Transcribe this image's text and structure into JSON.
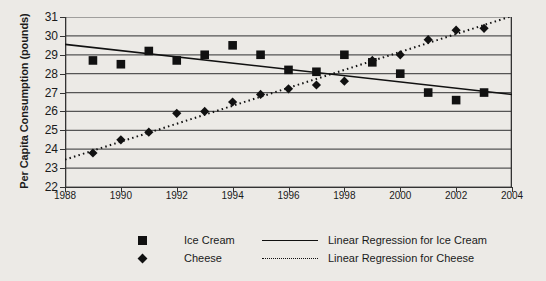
{
  "chart_data": {
    "type": "scatter",
    "title": "",
    "xlabel": "",
    "ylabel": "Per Capita Consumption (pounds)",
    "xlim": [
      1988,
      2004
    ],
    "ylim": [
      22,
      31
    ],
    "xticks": [
      1988,
      1990,
      1992,
      1994,
      1996,
      1998,
      2000,
      2002,
      2004
    ],
    "yticks": [
      22,
      23,
      24,
      25,
      26,
      27,
      28,
      29,
      30,
      31
    ],
    "grid": true,
    "legend_position": "bottom",
    "series": [
      {
        "name": "Ice Cream",
        "marker": "square",
        "color": "#111111",
        "x": [
          1989,
          1990,
          1991,
          1992,
          1993,
          1994,
          1995,
          1996,
          1997,
          1998,
          1999,
          2000,
          2001,
          2002,
          2003
        ],
        "values": [
          28.7,
          28.5,
          29.2,
          28.7,
          29.0,
          29.5,
          29.0,
          28.2,
          28.1,
          29.0,
          28.6,
          28.0,
          27.0,
          26.6,
          27.0
        ]
      },
      {
        "name": "Cheese",
        "marker": "diamond",
        "color": "#111111",
        "x": [
          1989,
          1990,
          1991,
          1992,
          1993,
          1994,
          1995,
          1996,
          1997,
          1998,
          1999,
          2000,
          2001,
          2002,
          2003
        ],
        "values": [
          23.8,
          24.5,
          24.9,
          25.9,
          26.0,
          26.5,
          26.9,
          27.2,
          27.4,
          27.6,
          28.7,
          29.0,
          29.8,
          30.3,
          30.4
        ]
      },
      {
        "name": "Linear Regression for Ice Cream",
        "marker": "line-solid",
        "color": "#111111",
        "x": [
          1988,
          2004
        ],
        "values": [
          29.55,
          26.9
        ]
      },
      {
        "name": "Linear Regression for Cheese",
        "marker": "line-dotted",
        "color": "#111111",
        "x": [
          1988,
          2004
        ],
        "values": [
          23.45,
          31.05
        ]
      }
    ]
  },
  "axes": {
    "y_title": "Per Capita Consumption (pounds)",
    "y_tick_labels": [
      "31",
      "30",
      "29",
      "28",
      "27",
      "26",
      "25",
      "24",
      "23",
      "22"
    ],
    "x_tick_labels": [
      "1988",
      "1990",
      "1992",
      "1994",
      "1996",
      "1998",
      "2000",
      "2002",
      "2004"
    ]
  },
  "legend": {
    "items": [
      {
        "label": "Ice Cream",
        "marker": "square"
      },
      {
        "label": "Linear Regression for Ice Cream",
        "marker": "line-solid"
      },
      {
        "label": "Cheese",
        "marker": "diamond"
      },
      {
        "label": "Linear Regression for Cheese",
        "marker": "line-dotted"
      }
    ]
  },
  "colors": {
    "ink": "#111111",
    "grid": "#555555",
    "background": "#eceae6"
  }
}
